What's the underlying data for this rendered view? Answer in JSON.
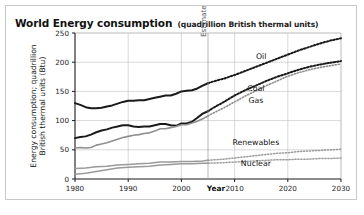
{
  "figure": {
    "title_main": "World Energy consumption",
    "title_sub": "(quadrillion British thermal units)",
    "background": "#ffffff",
    "border_color": "#c9c9c9"
  },
  "chart_data": {
    "type": "line",
    "title": "World Energy consumption (quadrillion British thermal units)",
    "xlabel": "Year",
    "ylabel": "Energy consumption; quadrillion British thermal units (Btu)",
    "xlim": [
      1980,
      2030
    ],
    "ylim": [
      0,
      250
    ],
    "xticks": [
      1980,
      1990,
      2000,
      2010,
      2020,
      2030
    ],
    "xticklabels": [
      "1980",
      "1990",
      "2000",
      "2010",
      "2020",
      "2030"
    ],
    "yticks": [
      0,
      50,
      100,
      150,
      200,
      250
    ],
    "yticklabels": [
      "0",
      "50",
      "100",
      "150",
      "200",
      "250"
    ],
    "grid": true,
    "legend": "inline-labels",
    "annotations": [
      {
        "text": "Estimated",
        "x": 2005,
        "orientation": "vertical",
        "note": "divider between historical and projected data"
      }
    ],
    "projection_start_year": 2005,
    "series": [
      {
        "name": "Oil",
        "color": "#1a1a1a",
        "width": 2.0,
        "label_x": 2015,
        "label_y": 205,
        "x": [
          1980,
          1981,
          1982,
          1983,
          1984,
          1985,
          1986,
          1987,
          1988,
          1989,
          1990,
          1991,
          1992,
          1993,
          1994,
          1995,
          1996,
          1997,
          1998,
          1999,
          2000,
          2001,
          2002,
          2003,
          2004,
          2005,
          2006,
          2008,
          2010,
          2012,
          2014,
          2016,
          2018,
          2020,
          2022,
          2024,
          2026,
          2028,
          2030
        ],
        "values": [
          130,
          127,
          123,
          121,
          121,
          122,
          124,
          126,
          129,
          132,
          134,
          134,
          135,
          135,
          137,
          139,
          141,
          143,
          143,
          146,
          150,
          151,
          152,
          155,
          160,
          164,
          167,
          172,
          178,
          185,
          192,
          199,
          206,
          213,
          220,
          226,
          232,
          237,
          241
        ]
      },
      {
        "name": "Coal",
        "color": "#1a1a1a",
        "width": 2.0,
        "label_x": 2014,
        "label_y": 150,
        "x": [
          1980,
          1981,
          1982,
          1983,
          1984,
          1985,
          1986,
          1987,
          1988,
          1989,
          1990,
          1991,
          1992,
          1993,
          1994,
          1995,
          1996,
          1997,
          1998,
          1999,
          2000,
          2001,
          2002,
          2003,
          2004,
          2005,
          2006,
          2008,
          2010,
          2012,
          2014,
          2016,
          2018,
          2020,
          2022,
          2024,
          2026,
          2028,
          2030
        ],
        "values": [
          70,
          72,
          73,
          76,
          80,
          83,
          85,
          88,
          90,
          92,
          92,
          90,
          89,
          90,
          90,
          92,
          94,
          94,
          92,
          91,
          95,
          95,
          98,
          105,
          112,
          116,
          122,
          132,
          143,
          152,
          160,
          168,
          175,
          181,
          187,
          192,
          196,
          199,
          202
        ]
      },
      {
        "name": "Gas",
        "color": "#8f8f8f",
        "width": 1.6,
        "label_x": 2014,
        "label_y": 130,
        "x": [
          1980,
          1981,
          1982,
          1983,
          1984,
          1985,
          1986,
          1987,
          1988,
          1989,
          1990,
          1991,
          1992,
          1993,
          1994,
          1995,
          1996,
          1997,
          1998,
          1999,
          2000,
          2001,
          2002,
          2003,
          2004,
          2005,
          2006,
          2008,
          2010,
          2012,
          2014,
          2016,
          2018,
          2020,
          2022,
          2024,
          2026,
          2028,
          2030
        ],
        "values": [
          53,
          54,
          53,
          54,
          58,
          60,
          62,
          65,
          68,
          71,
          73,
          75,
          76,
          78,
          79,
          82,
          86,
          86,
          88,
          90,
          93,
          93,
          96,
          99,
          103,
          108,
          113,
          122,
          132,
          142,
          151,
          160,
          168,
          176,
          182,
          187,
          191,
          194,
          197
        ]
      },
      {
        "name": "Renewables",
        "color": "#9a9a9a",
        "width": 1.5,
        "label_x": 2014,
        "label_y": 58,
        "x": [
          1980,
          1982,
          1984,
          1986,
          1988,
          1990,
          1992,
          1994,
          1996,
          1998,
          2000,
          2002,
          2004,
          2005,
          2008,
          2010,
          2012,
          2014,
          2016,
          2018,
          2020,
          2022,
          2024,
          2026,
          2028,
          2030
        ],
        "values": [
          18,
          19,
          21,
          22,
          24,
          25,
          26,
          27,
          29,
          29,
          30,
          30,
          31,
          32,
          34,
          36,
          38,
          40,
          42,
          44,
          45,
          47,
          48,
          49,
          50,
          51
        ]
      },
      {
        "name": "Nuclear",
        "color": "#9a9a9a",
        "width": 1.5,
        "label_x": 2014,
        "label_y": 22,
        "x": [
          1980,
          1982,
          1984,
          1986,
          1988,
          1990,
          1992,
          1994,
          1996,
          1998,
          2000,
          2002,
          2004,
          2005,
          2008,
          2010,
          2012,
          2014,
          2016,
          2018,
          2020,
          2022,
          2024,
          2026,
          2028,
          2030
        ],
        "values": [
          8,
          10,
          13,
          16,
          19,
          20,
          21,
          22,
          24,
          25,
          26,
          26,
          27,
          27,
          28,
          29,
          30,
          31,
          32,
          33,
          33,
          34,
          34,
          35,
          35,
          36
        ]
      }
    ]
  }
}
